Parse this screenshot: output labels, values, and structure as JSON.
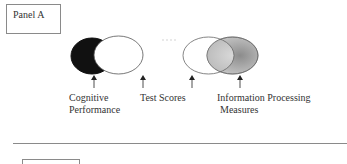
{
  "panel_a": {
    "title": "Panel A"
  },
  "panel_b": {
    "title": ""
  },
  "diagram": {
    "left_venn": {
      "circles": [
        {
          "name": "Cognitive Performance",
          "fill": "#111111"
        },
        {
          "name": "Test Scores",
          "fill": "#ffffff"
        }
      ]
    },
    "right_venn": {
      "circles": [
        {
          "name": "Test Scores",
          "fill": "#ffffff"
        },
        {
          "name": "Information Processing Measures",
          "fill": "#9a9a9a"
        }
      ]
    },
    "labels": {
      "cognitive_line1": "Cognitive",
      "cognitive_line2": "Performance",
      "test_scores": "Test  Scores",
      "info_line1": "Information Processing",
      "info_line2": "Measures"
    }
  }
}
